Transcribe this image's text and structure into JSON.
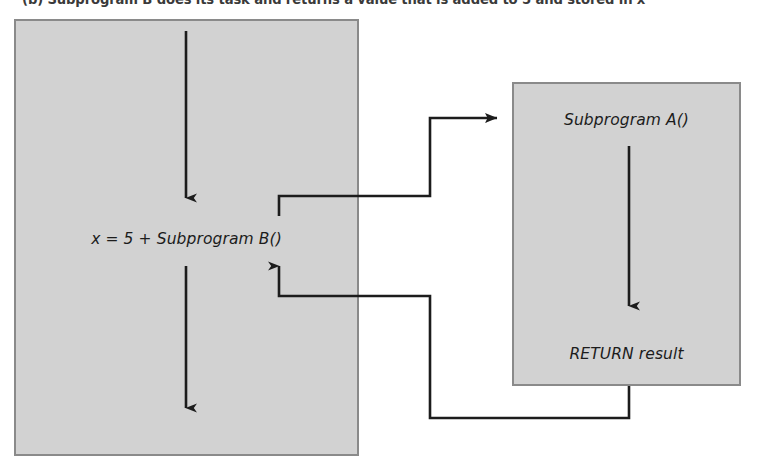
{
  "figure": {
    "caption": "(b) Subprogram B does its task and returns a value that is added to 5 and stored in x",
    "boxes": {
      "main_program": {
        "label": "x = 5 + Subprogram B()",
        "fill_color": "#d2d2d2",
        "border_color": "#8a8a8a"
      },
      "subprogram_a": {
        "title": "Subprogram A()",
        "return_statement": "RETURN result",
        "fill_color": "#d2d2d2",
        "border_color": "#8a8a8a"
      }
    },
    "arrows": {
      "line_color": "#1c1c1c",
      "flow_down_main_top": "flow-arrow-down",
      "flow_down_main_bottom": "flow-arrow-down",
      "flow_down_subprogram": "flow-arrow-down",
      "call_arrow": "call-arrow-right",
      "return_arrow": "return-arrow-up"
    }
  }
}
